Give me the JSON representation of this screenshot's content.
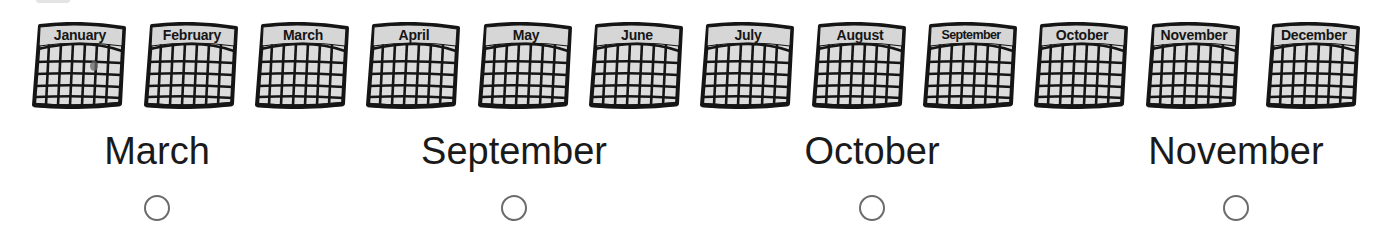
{
  "calendars": [
    {
      "month": "January",
      "x": 30,
      "mark": true,
      "tight": false
    },
    {
      "month": "February",
      "x": 142,
      "mark": false,
      "tight": false
    },
    {
      "month": "March",
      "x": 253,
      "mark": false,
      "tight": false
    },
    {
      "month": "April",
      "x": 364,
      "mark": false,
      "tight": false
    },
    {
      "month": "May",
      "x": 476,
      "mark": false,
      "tight": false
    },
    {
      "month": "June",
      "x": 587,
      "mark": false,
      "tight": false
    },
    {
      "month": "July",
      "x": 698,
      "mark": false,
      "tight": false
    },
    {
      "month": "August",
      "x": 810,
      "mark": false,
      "tight": false
    },
    {
      "month": "September",
      "x": 921,
      "mark": false,
      "tight": true
    },
    {
      "month": "October",
      "x": 1032,
      "mark": false,
      "tight": false
    },
    {
      "month": "November",
      "x": 1144,
      "mark": false,
      "tight": false
    },
    {
      "month": "December",
      "x": 1264,
      "mark": false,
      "tight": false
    }
  ],
  "options": [
    {
      "label": "March",
      "center_x": 157,
      "selected": false
    },
    {
      "label": "September",
      "center_x": 514,
      "selected": false
    },
    {
      "label": "October",
      "center_x": 872,
      "selected": false
    },
    {
      "label": "November",
      "center_x": 1236,
      "selected": false
    }
  ],
  "colors": {
    "ink": "#151515",
    "cell_fill": "#dcdcdc",
    "header_fill": "#d6d6d6",
    "radio_border": "#6b6b6b",
    "text": "#1a1a1a"
  }
}
